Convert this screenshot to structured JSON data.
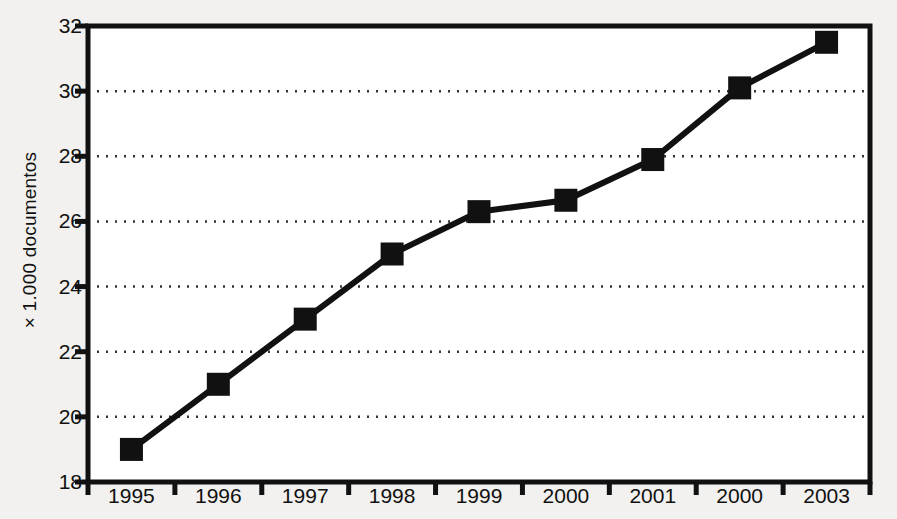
{
  "chart_data": {
    "type": "line",
    "title": "",
    "subtitle": "",
    "xlabel": "",
    "ylabel": "× 1.000 documentos",
    "categories": [
      "1995",
      "1996",
      "1997",
      "1998",
      "1999",
      "2000",
      "2001",
      "2000",
      "2003"
    ],
    "values": [
      19.0,
      21.0,
      23.0,
      25.0,
      26.3,
      26.65,
      27.9,
      30.1,
      31.5
    ],
    "series": [
      {
        "name": "documentos",
        "values": [
          19.0,
          21.0,
          23.0,
          25.0,
          26.3,
          26.65,
          27.9,
          30.1,
          31.5
        ]
      }
    ],
    "ylim": [
      18,
      32
    ],
    "ytick_step": 2,
    "yticks": [
      18,
      20,
      22,
      24,
      26,
      28,
      30,
      32
    ],
    "ytick_labels": [
      "18",
      "20",
      "22",
      "24",
      "26",
      "28",
      "30",
      "32"
    ],
    "grid": true,
    "grid_axis": "y",
    "grid_style": "dotted",
    "legend": false,
    "legend_position": "none",
    "marker": "square",
    "line_color": "#111111",
    "marker_color": "#111111",
    "grid_color": "#333333",
    "axis_color": "#111111",
    "background_color": "#f2f1ef",
    "plot_background_color": "#ffffff",
    "annotations": []
  }
}
